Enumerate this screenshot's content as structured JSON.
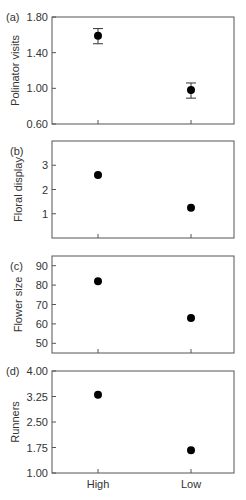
{
  "chart_data": [
    {
      "type": "scatter",
      "panel": "(a)",
      "ylabel": "Polinator visits",
      "categories": [
        "High",
        "Low"
      ],
      "values": [
        1.59,
        0.98
      ],
      "error_low": [
        1.5,
        0.89
      ],
      "error_high": [
        1.67,
        1.06
      ],
      "ylim": [
        0.6,
        1.8
      ],
      "yticks": [
        "0.60",
        "1.00",
        "1.40",
        "1.80"
      ],
      "ytick_values": [
        0.6,
        1.0,
        1.4,
        1.8
      ]
    },
    {
      "type": "scatter",
      "panel": "(b)",
      "ylabel": "Floral display",
      "categories": [
        "High",
        "Low"
      ],
      "values": [
        2.6,
        1.25
      ],
      "ylim": [
        0.0,
        4.0
      ],
      "yticks": [
        "1",
        "2",
        "3"
      ],
      "ytick_values": [
        1,
        2,
        3
      ]
    },
    {
      "type": "scatter",
      "panel": "(c)",
      "ylabel": "Flower size",
      "categories": [
        "High",
        "Low"
      ],
      "values": [
        82,
        63
      ],
      "ylim": [
        45,
        95
      ],
      "yticks": [
        "50",
        "60",
        "70",
        "80",
        "90"
      ],
      "ytick_values": [
        50,
        60,
        70,
        80,
        90
      ]
    },
    {
      "type": "scatter",
      "panel": "(d)",
      "ylabel": "Runners",
      "xlabel": "",
      "categories": [
        "High",
        "Low"
      ],
      "values": [
        3.3,
        1.67
      ],
      "ylim": [
        1.0,
        4.0
      ],
      "yticks": [
        "1.00",
        "1.75",
        "2.50",
        "3.25",
        "4.00"
      ],
      "ytick_values": [
        1.0,
        1.75,
        2.5,
        3.25,
        4.0
      ]
    }
  ],
  "layout": {
    "panels": [
      {
        "top": 17,
        "bottom": 124
      },
      {
        "top": 141,
        "bottom": 238
      },
      {
        "top": 256,
        "bottom": 353
      },
      {
        "top": 371,
        "bottom": 473
      }
    ],
    "left": 52,
    "right": 234,
    "x_positions": [
      98,
      191
    ],
    "point_color": "#000000",
    "frame_color": "#555555"
  }
}
